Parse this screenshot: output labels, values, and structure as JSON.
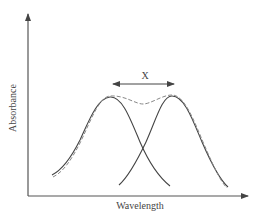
{
  "diagram": {
    "type": "overlapping-absorption-bands",
    "axes": {
      "x_label": "Wavelength",
      "y_label": "Absorbance"
    },
    "separation_label": "X",
    "curves": [
      {
        "name": "band-1",
        "style": "solid",
        "peak_x": 110,
        "peak_y": 97
      },
      {
        "name": "band-2",
        "style": "solid",
        "peak_x": 172,
        "peak_y": 96
      },
      {
        "name": "sum-envelope",
        "style": "dashed"
      }
    ],
    "colors": {
      "axis": "#555555",
      "curve": "#444444",
      "envelope": "#888888",
      "background": "#ffffff"
    }
  }
}
